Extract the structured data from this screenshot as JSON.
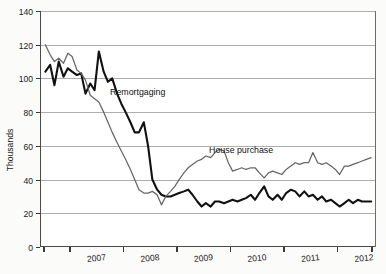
{
  "chart_data": {
    "type": "line",
    "title": "",
    "subtitle": "",
    "xlabel": "",
    "ylabel": "Thousands",
    "ylim": [
      0,
      140
    ],
    "ytick_step": 20,
    "yticks": [
      "0",
      "20",
      "40",
      "60",
      "80",
      "100",
      "120",
      "140"
    ],
    "xticks": [
      "2007",
      "2008",
      "2009",
      "2010",
      "2011",
      "2012"
    ],
    "xlim_label_start": "2006.5",
    "xlim_label_end": "2012.75",
    "grid": "horizontal",
    "legend_position": "inline-annotations",
    "annotations": [
      {
        "text": "Remortgaging",
        "x": 2007.75,
        "y": 90
      },
      {
        "text": "House purchase",
        "x": 2009.6,
        "y": 56
      }
    ],
    "series": [
      {
        "name": "Remortgaging",
        "color": "#111111",
        "linewidth": 2.1,
        "x": [
          2006.54,
          2006.63,
          2006.71,
          2006.79,
          2006.88,
          2006.96,
          2007.04,
          2007.13,
          2007.21,
          2007.29,
          2007.38,
          2007.46,
          2007.54,
          2007.63,
          2007.71,
          2007.79,
          2007.88,
          2007.96,
          2008.04,
          2008.13,
          2008.21,
          2008.29,
          2008.38,
          2008.46,
          2008.54,
          2008.63,
          2008.71,
          2008.79,
          2008.88,
          2008.96,
          2009.04,
          2009.13,
          2009.21,
          2009.29,
          2009.38,
          2009.46,
          2009.54,
          2009.63,
          2009.71,
          2009.79,
          2009.88,
          2009.96,
          2010.04,
          2010.13,
          2010.21,
          2010.29,
          2010.38,
          2010.46,
          2010.54,
          2010.63,
          2010.71,
          2010.79,
          2010.88,
          2010.96,
          2011.04,
          2011.13,
          2011.21,
          2011.29,
          2011.38,
          2011.46,
          2011.54,
          2011.63,
          2011.71,
          2011.79,
          2011.88,
          2011.96,
          2012.04,
          2012.13,
          2012.21,
          2012.29,
          2012.38,
          2012.46,
          2012.54,
          2012.63
        ],
        "values": [
          104,
          108,
          96,
          110,
          101,
          106,
          104,
          102,
          103,
          91,
          97,
          93,
          116,
          104,
          98,
          100,
          91,
          85,
          80,
          74,
          68,
          68,
          74,
          60,
          40,
          34,
          31,
          30,
          30,
          31,
          32,
          33,
          34,
          31,
          27,
          24,
          26,
          24,
          27,
          27,
          26,
          27,
          28,
          27,
          28,
          29,
          31,
          28,
          32,
          36,
          30,
          28,
          31,
          28,
          32,
          34,
          33,
          30,
          33,
          30,
          31,
          28,
          30,
          27,
          28,
          26,
          24,
          26,
          28,
          26,
          28,
          27,
          27,
          27
        ]
      },
      {
        "name": "House purchase",
        "color": "#666666",
        "linewidth": 1.25,
        "x": [
          2006.54,
          2006.63,
          2006.71,
          2006.79,
          2006.88,
          2006.96,
          2007.04,
          2007.13,
          2007.21,
          2007.29,
          2007.38,
          2007.46,
          2007.54,
          2007.63,
          2007.71,
          2007.79,
          2007.88,
          2007.96,
          2008.04,
          2008.13,
          2008.21,
          2008.29,
          2008.38,
          2008.46,
          2008.54,
          2008.63,
          2008.71,
          2008.79,
          2008.88,
          2008.96,
          2009.04,
          2009.13,
          2009.21,
          2009.29,
          2009.38,
          2009.46,
          2009.54,
          2009.63,
          2009.71,
          2009.79,
          2009.88,
          2009.96,
          2010.04,
          2010.13,
          2010.21,
          2010.29,
          2010.38,
          2010.46,
          2010.54,
          2010.63,
          2010.71,
          2010.79,
          2010.88,
          2010.96,
          2011.04,
          2011.13,
          2011.21,
          2011.29,
          2011.38,
          2011.46,
          2011.54,
          2011.63,
          2011.71,
          2011.79,
          2011.88,
          2011.96,
          2012.04,
          2012.13,
          2012.21,
          2012.29,
          2012.38,
          2012.46,
          2012.54,
          2012.63
        ],
        "values": [
          120,
          114,
          110,
          112,
          109,
          115,
          113,
          105,
          103,
          99,
          90,
          88,
          86,
          80,
          74,
          68,
          62,
          57,
          52,
          46,
          40,
          34,
          32,
          32,
          33,
          31,
          25,
          30,
          33,
          36,
          40,
          44,
          47,
          49,
          51,
          52,
          54,
          53,
          56,
          58,
          57,
          50,
          45,
          46,
          47,
          46,
          47,
          47,
          44,
          41,
          44,
          45,
          44,
          43,
          46,
          48,
          50,
          49,
          50,
          50,
          56,
          50,
          49,
          50,
          48,
          46,
          43,
          48,
          48,
          49,
          50,
          51,
          52,
          53
        ]
      }
    ]
  },
  "layout": {
    "plot_left": 40,
    "plot_right": 376,
    "plot_top": 11,
    "plot_bottom": 247,
    "x_value_min": 2006.44,
    "x_value_max": 2012.72
  }
}
